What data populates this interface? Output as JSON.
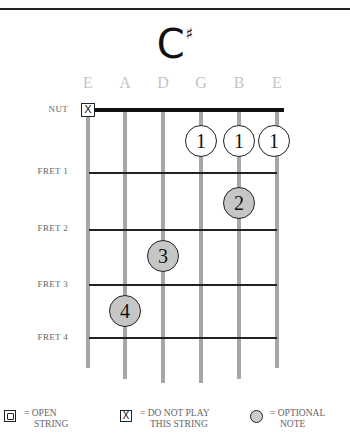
{
  "chord": {
    "root": "C",
    "accidental": "♯",
    "name": "C#"
  },
  "strings": [
    {
      "name": "E",
      "x": 88,
      "bottom": 368,
      "state": "muted"
    },
    {
      "name": "A",
      "x": 125,
      "bottom": 379
    },
    {
      "name": "D",
      "x": 163,
      "bottom": 383
    },
    {
      "name": "G",
      "x": 201,
      "bottom": 383
    },
    {
      "name": "B",
      "x": 239,
      "bottom": 379
    },
    {
      "name": "E",
      "x": 277,
      "bottom": 368
    }
  ],
  "labels": {
    "nut": "NUT",
    "fret1": "FRET 1",
    "fret2": "FRET 2",
    "fret3": "FRET 3",
    "fret4": "FRET 4"
  },
  "mute_symbol": "X",
  "fingers": [
    {
      "string": "G",
      "finger": "1",
      "x": 201,
      "y": 141,
      "style": "open"
    },
    {
      "string": "B",
      "finger": "1",
      "x": 239,
      "y": 141,
      "style": "open"
    },
    {
      "string": "E",
      "finger": "1",
      "x": 272,
      "y": 141,
      "style": "open"
    },
    {
      "string": "B",
      "finger": "2",
      "x": 239,
      "y": 203,
      "style": "fill"
    },
    {
      "string": "D",
      "finger": "3",
      "x": 163,
      "y": 256,
      "style": "fill"
    },
    {
      "string": "A",
      "finger": "4",
      "x": 125,
      "y": 311,
      "style": "fill"
    }
  ],
  "legend": {
    "open": {
      "line1": "= OPEN",
      "line2": "STRING"
    },
    "mute": {
      "symbol": "X",
      "line1": "= DO NOT PLAY",
      "line2": "THIS STRING"
    },
    "optional": {
      "line1": "= OPTIONAL",
      "line2": "NOTE"
    }
  },
  "colors": {
    "string": "#a6a6a6",
    "fret": "#222222",
    "fill_dot": "#c6c6c6",
    "string_name": "#c4c4c4"
  }
}
